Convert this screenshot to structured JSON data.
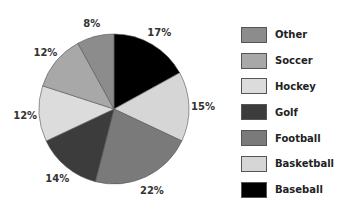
{
  "chart_data": {
    "type": "pie",
    "title": "",
    "slices": [
      {
        "label": "Baseball",
        "value": 17,
        "color": "#000000"
      },
      {
        "label": "Basketball",
        "value": 15,
        "color": "#d6d6d6"
      },
      {
        "label": "Football",
        "value": 22,
        "color": "#7a7a7a"
      },
      {
        "label": "Golf",
        "value": 14,
        "color": "#3c3c3c"
      },
      {
        "label": "Hockey",
        "value": 12,
        "color": "#dcdcdc"
      },
      {
        "label": "Soccer",
        "value": 12,
        "color": "#a8a8a8"
      },
      {
        "label": "Other",
        "value": 8,
        "color": "#8c8c8c"
      }
    ],
    "legend_order": [
      "Other",
      "Soccer",
      "Hockey",
      "Golf",
      "Football",
      "Basketball",
      "Baseball"
    ],
    "legend_position": "right"
  }
}
